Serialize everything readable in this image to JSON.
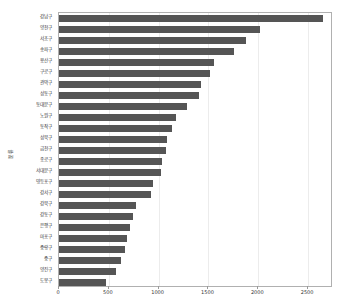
{
  "chart_data": {
    "type": "bar",
    "orientation": "horizontal",
    "title": "",
    "xlabel": "",
    "ylabel": "분류",
    "xlim": [
      0,
      2750
    ],
    "ylim": [
      0,
      25
    ],
    "grid": true,
    "legend": null,
    "bar_color": "#555555",
    "xticks": [
      0,
      500,
      1000,
      1500,
      2000,
      2500
    ],
    "xticklabels": [
      "0",
      "500",
      "1000",
      "1500",
      "2000",
      "2500"
    ],
    "categories": [
      "강남구",
      "양천구",
      "서초구",
      "송파구",
      "용산구",
      "구로구",
      "관악구",
      "성동구",
      "동대문구",
      "노원구",
      "동작구",
      "성북구",
      "금천구",
      "종로구",
      "서대문구",
      "영등포구",
      "강서구",
      "강북구",
      "강동구",
      "은평구",
      "마포구",
      "중랑구",
      "중구",
      "양진구",
      "도봉구"
    ],
    "values": [
      2650,
      2020,
      1880,
      1760,
      1560,
      1520,
      1430,
      1410,
      1280,
      1170,
      1130,
      1085,
      1075,
      1030,
      1025,
      945,
      925,
      770,
      745,
      710,
      680,
      665,
      625,
      570,
      470
    ]
  }
}
